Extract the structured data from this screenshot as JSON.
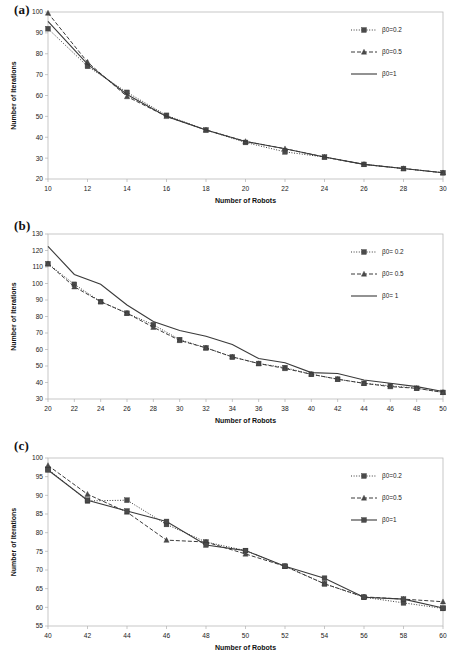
{
  "figure": {
    "panels": [
      {
        "label": "(a)",
        "xlabel": "Number of Robots",
        "ylabel": "Number of Iterations",
        "legend": [
          "β0=0.2",
          "β0=0.5",
          "β0=1"
        ],
        "chart_data": {
          "type": "line",
          "title": "",
          "xlabel": "Number of Robots",
          "ylabel": "Number of Iterations",
          "xlim": [
            10,
            30
          ],
          "ylim": [
            20,
            100
          ],
          "xticks": [
            10,
            12,
            14,
            16,
            18,
            20,
            22,
            24,
            26,
            28,
            30
          ],
          "yticks": [
            20,
            30,
            40,
            50,
            60,
            70,
            80,
            90,
            100
          ],
          "grid": false,
          "legend_position": "top-right",
          "x": [
            10,
            12,
            14,
            16,
            18,
            20,
            22,
            24,
            26,
            28,
            30
          ],
          "series": [
            {
              "name": "β0=0.2",
              "marker": "square",
              "style": "dotted",
              "values": [
                92,
                74,
                61.5,
                50.5,
                43.5,
                37.5,
                33,
                30.5,
                27,
                25,
                23
              ]
            },
            {
              "name": "β0=0.5",
              "marker": "triangle",
              "style": "dashed",
              "values": [
                99.5,
                76,
                59.5,
                50,
                43.5,
                38,
                34.5,
                30.5,
                27,
                25,
                23
              ]
            },
            {
              "name": "β0=1",
              "marker": "none",
              "style": "solid",
              "values": [
                95.5,
                75,
                60.5,
                50,
                43.5,
                38,
                34.5,
                30.5,
                27,
                25,
                23
              ]
            }
          ]
        }
      },
      {
        "label": "(b)",
        "xlabel": "Number of Robots",
        "ylabel": "Number of Iterations",
        "legend": [
          "β0= 0.2",
          "β0= 0.5",
          "β0= 1"
        ],
        "chart_data": {
          "type": "line",
          "title": "",
          "xlabel": "Number of Robots",
          "ylabel": "Number of Iterations",
          "xlim": [
            20,
            50
          ],
          "ylim": [
            30,
            130
          ],
          "xticks": [
            20,
            22,
            24,
            26,
            28,
            30,
            32,
            34,
            36,
            38,
            40,
            42,
            44,
            46,
            48,
            50
          ],
          "yticks": [
            30,
            40,
            50,
            60,
            70,
            80,
            90,
            100,
            110,
            120,
            130
          ],
          "grid": false,
          "legend_position": "top-right",
          "x": [
            20,
            22,
            24,
            26,
            28,
            30,
            32,
            34,
            36,
            38,
            40,
            42,
            44,
            46,
            48,
            50
          ],
          "series": [
            {
              "name": "β0= 0.2",
              "marker": "square",
              "style": "dotted",
              "values": [
                112,
                99.5,
                89,
                82,
                75,
                66,
                61,
                55.5,
                51.5,
                49,
                45,
                42,
                39.5,
                38,
                36.5,
                34
              ]
            },
            {
              "name": "β0= 0.5",
              "marker": "triangle",
              "style": "dashed",
              "values": [
                112,
                98,
                89,
                82,
                73.5,
                65.5,
                61,
                55.5,
                51.5,
                48.5,
                45,
                42,
                39.5,
                37.5,
                36.5,
                34
              ]
            },
            {
              "name": "β0= 1",
              "marker": "none",
              "style": "solid",
              "values": [
                122.5,
                105.5,
                99.5,
                87,
                77,
                71.5,
                68,
                63,
                54.5,
                52,
                46,
                45.5,
                41.5,
                39.5,
                37.5,
                34.5
              ]
            }
          ]
        }
      },
      {
        "label": "(c)",
        "xlabel": "Number of Robots",
        "ylabel": "Number of Iterations",
        "legend": [
          "β0=0.2",
          "β0=0.5",
          "β0=1"
        ],
        "chart_data": {
          "type": "line",
          "title": "",
          "xlabel": "Number of Robots",
          "ylabel": "Number of Iterations",
          "xlim": [
            40,
            60
          ],
          "ylim": [
            55,
            100
          ],
          "xticks": [
            40,
            42,
            44,
            46,
            48,
            50,
            52,
            54,
            56,
            58,
            60
          ],
          "yticks": [
            55,
            60,
            65,
            70,
            75,
            80,
            85,
            90,
            95,
            100
          ],
          "grid": false,
          "legend_position": "top-right",
          "x": [
            40,
            42,
            44,
            46,
            48,
            50,
            52,
            54,
            56,
            58,
            60
          ],
          "series": [
            {
              "name": "β0=0.2",
              "marker": "square",
              "style": "dotted",
              "values": [
                97,
                88.5,
                88.7,
                82.2,
                77.5,
                75.2,
                71,
                66.3,
                62.7,
                61.2,
                59.7
              ]
            },
            {
              "name": "β0=0.5",
              "marker": "triangle",
              "style": "dashed",
              "values": [
                98,
                90.3,
                85.5,
                78,
                77.5,
                74.3,
                71,
                66.3,
                62.8,
                62.2,
                61.5
              ]
            },
            {
              "name": "β0=1",
              "marker": "square",
              "style": "solid",
              "values": [
                96.8,
                88.7,
                85.8,
                83,
                76.7,
                75.2,
                71,
                67.8,
                62.7,
                62.2,
                59.8
              ]
            }
          ]
        }
      }
    ]
  }
}
